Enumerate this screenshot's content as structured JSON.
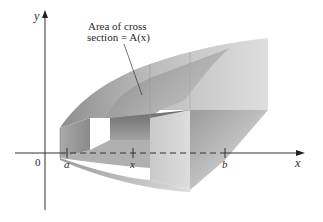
{
  "diagram": {
    "type": "solid-of-cross-sections",
    "annotation": {
      "line1": "Area of cross",
      "line2": "section = A(x)"
    },
    "axes": {
      "x_label": "x",
      "y_label": "y",
      "origin_label": "0"
    },
    "ticks": [
      {
        "label": "a"
      },
      {
        "label": "x"
      },
      {
        "label": "b"
      }
    ],
    "colors": {
      "axis": "#333333",
      "solid_light": "#e8e8e8",
      "solid_mid": "#b9b9b9",
      "solid_dark": "#7e7e7e",
      "text": "#2a2a2a"
    }
  }
}
